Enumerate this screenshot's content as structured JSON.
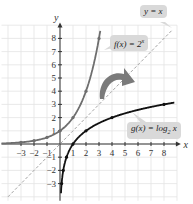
{
  "chart_data": {
    "type": "line",
    "title": "",
    "xlabel": "x",
    "ylabel": "y",
    "xlim": [
      -4.5,
      9
    ],
    "ylim": [
      -4,
      9
    ],
    "grid": true,
    "xticks": [
      -3,
      -2,
      -1,
      1,
      2,
      3,
      4,
      5,
      6,
      7,
      8
    ],
    "yticks": [
      -3,
      -2,
      -1,
      1,
      2,
      3,
      4,
      5,
      6,
      7,
      8
    ],
    "series": [
      {
        "name": "f(x) = 2^x",
        "label": "f(x) = 2",
        "label_exp": "x",
        "color": "#6e6e6e",
        "points": [
          [
            -3,
            0.125
          ],
          [
            -2,
            0.25
          ],
          [
            -1,
            0.5
          ],
          [
            0,
            1
          ],
          [
            1,
            2
          ],
          [
            2,
            4
          ],
          [
            3,
            8
          ]
        ]
      },
      {
        "name": "g(x) = log2 x",
        "label": "g(x) = log",
        "label_sub": "2",
        "label_tail": " x",
        "color": "#111111",
        "points": [
          [
            0.125,
            -3
          ],
          [
            0.25,
            -2
          ],
          [
            0.5,
            -1
          ],
          [
            1,
            0
          ],
          [
            2,
            1
          ],
          [
            4,
            2
          ],
          [
            8,
            3
          ]
        ]
      },
      {
        "name": "y = x",
        "label": "y = x",
        "color": "#9a9a9a",
        "style": "dashed",
        "points": [
          [
            -4,
            -4
          ],
          [
            8.5,
            8.5
          ]
        ]
      }
    ],
    "annotations": [
      "curved arrow indicating reflection across y = x"
    ]
  }
}
